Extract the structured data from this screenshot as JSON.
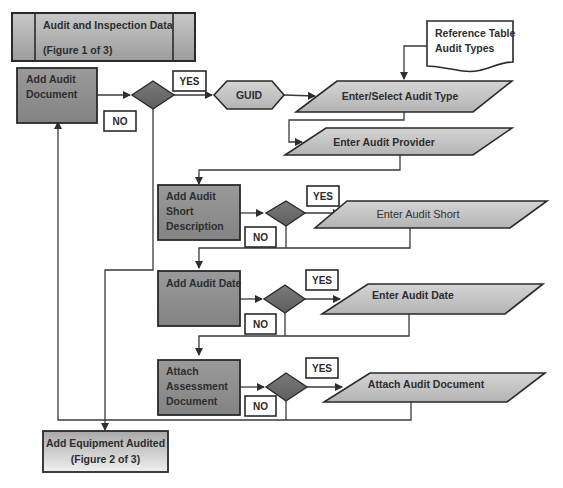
{
  "title_box": {
    "line1": "Audit and Inspection Data",
    "line2": "(Figure 1 of 3)"
  },
  "reference_doc": {
    "line1": "Reference Table",
    "line2": "Audit Types"
  },
  "processes": {
    "add_audit_document": {
      "line1": "Add Audit",
      "line2": "Document"
    },
    "add_audit_short_description": {
      "line1": "Add Audit",
      "line2": "Short",
      "line3": "Description"
    },
    "add_audit_date": {
      "line1": "Add Audit Date"
    },
    "attach_assessment_document": {
      "line1": "Attach",
      "line2": "Assessment",
      "line3": "Document"
    }
  },
  "guid": {
    "label": "GUID"
  },
  "inputs": {
    "enter_select_audit_type": "Enter/Select Audit Type",
    "enter_audit_provider": "Enter Audit Provider",
    "enter_audit_short": "Enter Audit Short",
    "enter_audit_date": "Enter Audit Date",
    "attach_audit_document": "Attach Audit Document"
  },
  "decision_labels": {
    "yes": "YES",
    "no": "NO"
  },
  "next_figure": {
    "line1": "Add Equipment Audited",
    "line2": "(Figure 2 of 3)"
  },
  "colors": {
    "process_fill": "#8a8a8a",
    "input_fill": "#c4c4c4",
    "decision_fill": "#6e6e6e",
    "line": "#3a3a3a"
  }
}
